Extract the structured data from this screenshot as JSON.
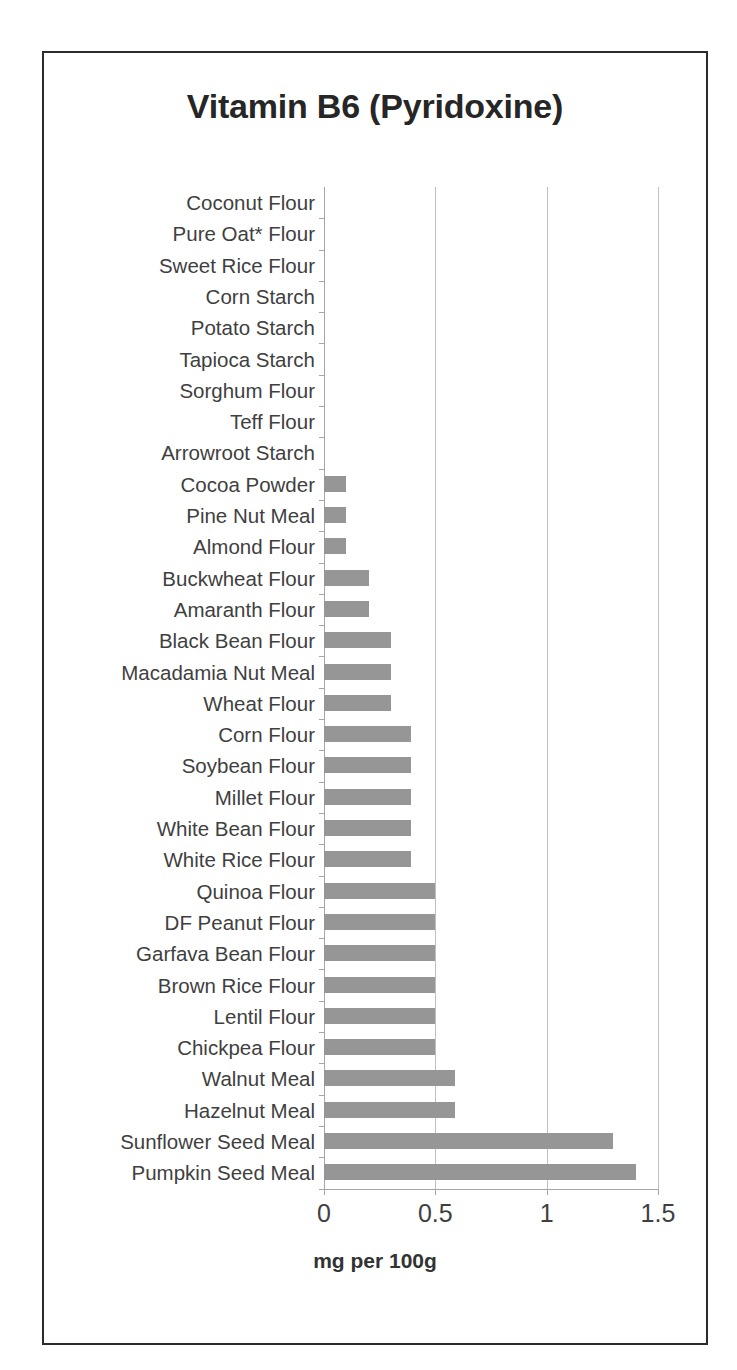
{
  "chart_data": {
    "type": "bar",
    "orientation": "horizontal",
    "title": "Vitamin B6 (Pyridoxine)",
    "xlabel": "mg per 100g",
    "ylabel": "",
    "xlim": [
      0,
      1.5
    ],
    "xticks": [
      "0",
      "0.5",
      "1",
      "1.5"
    ],
    "xtick_values": [
      0,
      0.5,
      1,
      1.5
    ],
    "grid": "vertical",
    "legend": "none",
    "bar_color": "#969696",
    "categories": [
      "Coconut Flour",
      "Pure Oat* Flour",
      "Sweet Rice Flour",
      "Corn Starch",
      "Potato Starch",
      "Tapioca Starch",
      "Sorghum Flour",
      "Teff Flour",
      "Arrowroot Starch",
      "Cocoa Powder",
      "Pine Nut Meal",
      "Almond Flour",
      "Buckwheat Flour",
      "Amaranth Flour",
      "Black Bean Flour",
      "Macadamia Nut Meal",
      "Wheat Flour",
      "Corn Flour",
      "Soybean Flour",
      "Millet Flour",
      "White Bean Flour",
      "White Rice Flour",
      "Quinoa Flour",
      "DF Peanut Flour",
      "Garfava Bean Flour",
      "Brown Rice Flour",
      "Lentil Flour",
      "Chickpea Flour",
      "Walnut Meal",
      "Hazelnut Meal",
      "Sunflower Seed Meal",
      "Pumpkin Seed Meal"
    ],
    "values": [
      0,
      0,
      0,
      0,
      0,
      0,
      0,
      0,
      0,
      0.1,
      0.1,
      0.1,
      0.2,
      0.2,
      0.3,
      0.3,
      0.3,
      0.39,
      0.39,
      0.39,
      0.39,
      0.39,
      0.5,
      0.5,
      0.5,
      0.5,
      0.5,
      0.5,
      0.59,
      0.59,
      1.3,
      1.4
    ]
  },
  "colors": {
    "bar": "#969696",
    "frame": "#2b2b2b",
    "grid": "#bfbfbf",
    "axis": "#a6a6a6",
    "text": "#3f3f3f",
    "title": "#262626"
  }
}
